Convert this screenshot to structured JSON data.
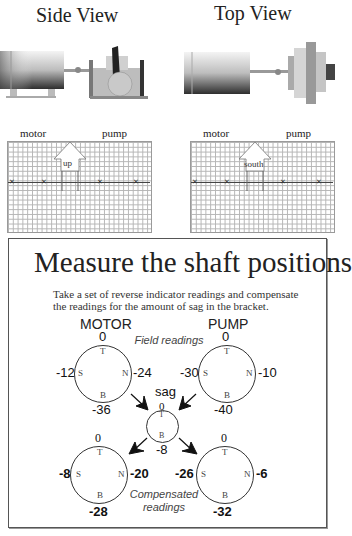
{
  "views": {
    "side": {
      "title": "Side View",
      "motor_label": "motor",
      "pump_label": "pump",
      "arrow_label": "up"
    },
    "top": {
      "title": "Top View",
      "motor_label": "motor",
      "pump_label": "pump",
      "arrow_label": "south"
    }
  },
  "panel": {
    "title": "Measure the shaft positions",
    "instructions_line1": "Take a set of reverse indicator readings and compensate",
    "instructions_line2": "the readings for the amount of sag in the bracket.",
    "motor_heading": "MOTOR",
    "pump_heading": "PUMP",
    "field_readings_label": "Field readings",
    "sag_label": "sag",
    "compensated_label_line1": "Compensated",
    "compensated_label_line2": "readings",
    "dial_letters": {
      "top": "T",
      "bottom": "B",
      "south": "S",
      "north": "N"
    },
    "field_motor": {
      "top": "0",
      "south": "-12",
      "north": "-24",
      "bottom": "-36"
    },
    "field_pump": {
      "top": "0",
      "south": "-30",
      "north": "-10",
      "bottom": "-40"
    },
    "sag": {
      "top": "0",
      "bottom": "-8"
    },
    "comp_motor": {
      "top": "0",
      "south": "-8",
      "north": "-20",
      "bottom": "-28"
    },
    "comp_pump": {
      "top": "0",
      "south": "-26",
      "north": "-6",
      "bottom": "-32"
    }
  }
}
